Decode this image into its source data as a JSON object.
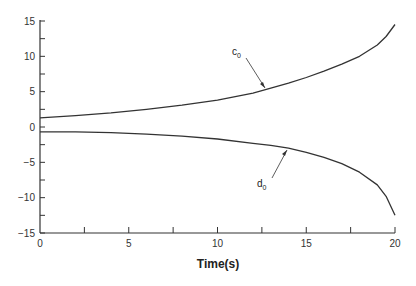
{
  "chart_data": {
    "type": "line",
    "title": "",
    "xlabel": "Time(s)",
    "ylabel": "",
    "xlim": [
      0,
      20
    ],
    "ylim": [
      -15,
      15
    ],
    "x_ticks": [
      0,
      5,
      10,
      15,
      20
    ],
    "x_minor_ticks": [
      2.5,
      7.5,
      12.5,
      17.5
    ],
    "y_ticks": [
      15,
      10,
      5,
      0,
      -5,
      -10,
      -15
    ],
    "y_minor_ticks": [
      12.5,
      7.5,
      2.5,
      -2.5,
      -7.5,
      -12.5
    ],
    "grid": false,
    "legend": "none (inline arrow annotations)",
    "x": [
      0,
      2,
      4,
      6,
      8,
      10,
      12,
      13,
      14,
      15,
      16,
      17,
      18,
      19,
      19.5,
      20
    ],
    "series": [
      {
        "name": "c0",
        "values": [
          1.3,
          1.6,
          2.0,
          2.5,
          3.1,
          3.8,
          4.8,
          5.5,
          6.2,
          7.0,
          7.9,
          8.9,
          10.0,
          11.6,
          12.8,
          14.5
        ]
      },
      {
        "name": "d0",
        "values": [
          -0.7,
          -0.7,
          -0.8,
          -1.0,
          -1.3,
          -1.7,
          -2.3,
          -2.6,
          -3.0,
          -3.6,
          -4.3,
          -5.2,
          -6.4,
          -8.2,
          -9.8,
          -12.5
        ]
      }
    ],
    "annotations": [
      {
        "text": "c0",
        "arrow_to": [
          12.8,
          5.5
        ]
      },
      {
        "text": "d0",
        "arrow_to": [
          14.5,
          -3.3
        ]
      }
    ]
  },
  "axis": {
    "x_tick_labels": [
      "0",
      "5",
      "10",
      "15",
      "20"
    ],
    "y_tick_labels": [
      "15",
      "10",
      "5",
      "0",
      "−5",
      "−10",
      "−15"
    ],
    "xlabel": "Time(s)"
  },
  "labels": {
    "c_main": "c",
    "c_sub": "0",
    "d_main": "d",
    "d_sub": "0"
  }
}
